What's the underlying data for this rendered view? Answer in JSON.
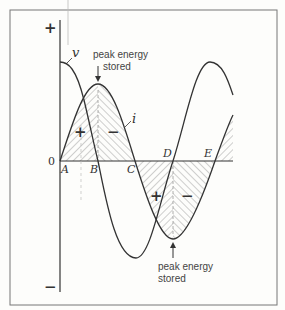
{
  "diagram": {
    "axis": {
      "plus": "+",
      "minus": "−",
      "zero": "0"
    },
    "points": {
      "A": "A",
      "B": "B",
      "C": "C",
      "D": "D",
      "E": "E"
    },
    "curves": {
      "voltage": "v",
      "current": "i"
    },
    "signs": {
      "pos1": "+",
      "neg1": "−",
      "pos2": "+",
      "neg2": "−"
    },
    "annotations": {
      "top_line1": "peak energy",
      "top_line2": "stored",
      "bottom_line1": "peak energy",
      "bottom_line2": "stored"
    },
    "colors": {
      "line": "#333333",
      "hatch": "#888888",
      "frame": "#666666"
    }
  }
}
